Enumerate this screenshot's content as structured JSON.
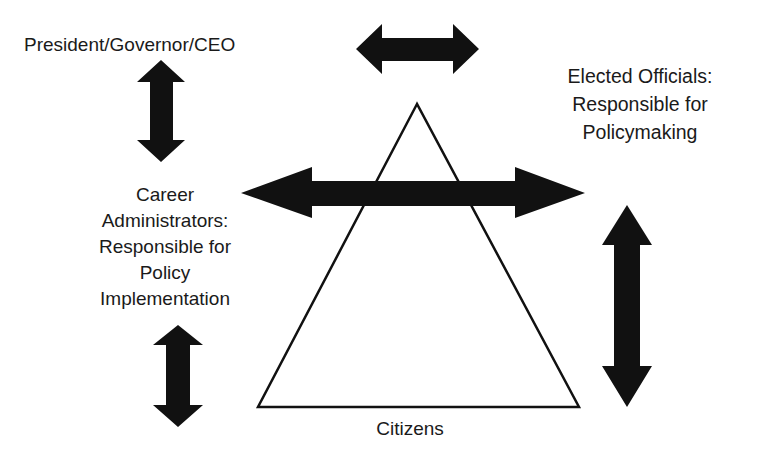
{
  "diagram": {
    "labels": {
      "executive": "President/Governor/CEO",
      "elected": "Elected Officials:\nResponsible for\nPolicymaking",
      "career": "Career\nAdministrators:\nResponsible for\nPolicy\nImplementation",
      "citizens": "Citizens"
    },
    "shapes": {
      "pyramid": {
        "type": "triangle",
        "apex": [
          417,
          104
        ],
        "base_left": [
          258,
          407
        ],
        "base_right": [
          579,
          407
        ]
      },
      "arrows": [
        {
          "id": "top-horizontal",
          "direction": "horizontal",
          "from": [
            356,
            49
          ],
          "to": [
            479,
            49
          ]
        },
        {
          "id": "executive-vertical",
          "direction": "vertical",
          "from": [
            161,
            60
          ],
          "to": [
            161,
            162
          ]
        },
        {
          "id": "central-horizontal",
          "direction": "horizontal",
          "from": [
            241,
            193
          ],
          "to": [
            585,
            193
          ]
        },
        {
          "id": "career-vertical",
          "direction": "vertical",
          "from": [
            178,
            325
          ],
          "to": [
            178,
            427
          ]
        },
        {
          "id": "elected-vertical",
          "direction": "vertical",
          "from": [
            627,
            205
          ],
          "to": [
            627,
            407
          ]
        }
      ]
    },
    "colors": {
      "ink": "#111111",
      "background": "#ffffff"
    }
  }
}
